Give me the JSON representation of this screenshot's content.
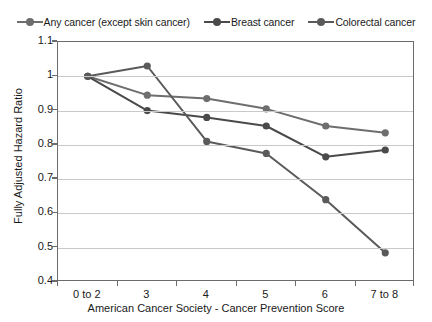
{
  "chart_data": {
    "type": "line",
    "title": "",
    "xlabel": "American Cancer Society - Cancer Prevention Score",
    "ylabel": "Fully Adjusted Hazard Ratio",
    "categories": [
      "0 to 2",
      "3",
      "4",
      "5",
      "6",
      "7 to 8"
    ],
    "yticks": [
      "0.4",
      "0.5",
      "0.6",
      "0.7",
      "0.8",
      "0.9",
      "1",
      "1.1"
    ],
    "ylim": [
      0.4,
      1.1
    ],
    "grid": true,
    "legend_position": "top",
    "series": [
      {
        "name": "Any cancer (except skin cancer)",
        "color": "#6e6e6e",
        "values": [
          1.0,
          0.945,
          0.935,
          0.905,
          0.855,
          0.835
        ]
      },
      {
        "name": "Breast cancer",
        "color": "#4a4a4a",
        "values": [
          1.0,
          0.9,
          0.88,
          0.855,
          0.765,
          0.785
        ]
      },
      {
        "name": "Colorectal cancer",
        "color": "#5a5a5a",
        "values": [
          1.0,
          1.03,
          0.81,
          0.775,
          0.64,
          0.485
        ]
      }
    ]
  }
}
